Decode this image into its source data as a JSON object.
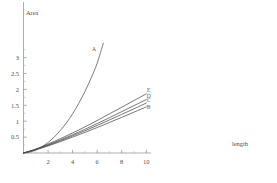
{
  "chart_data": {
    "type": "line",
    "title": "",
    "xlabel": "length",
    "ylabel": "Area",
    "xlim": [
      0,
      10.4
    ],
    "ylim": [
      0,
      3.45
    ],
    "grid": false,
    "legend": "inline-curve-labels",
    "x_ticks": [
      2,
      4,
      6,
      8,
      10
    ],
    "x_tick_labels": [
      "2",
      "4",
      "6",
      "8",
      "10"
    ],
    "x_minor_ticks": [
      1,
      3,
      5,
      7,
      9
    ],
    "y_ticks": [
      0.5,
      1,
      1.5,
      2,
      2.5,
      3
    ],
    "y_tick_labels": [
      "0.5",
      "1",
      "1.5",
      "2",
      "2.5",
      "3"
    ],
    "y_minor_ticks": [
      0.25,
      0.75,
      1.25,
      1.75,
      2.25,
      2.75,
      3.25
    ],
    "series": [
      {
        "name": "A",
        "label": "A",
        "label_x": 5.75,
        "label_y": 3.22,
        "color": "#5a5a5a",
        "x": [
          0,
          0.5,
          1,
          1.5,
          2,
          2.5,
          3,
          3.5,
          4,
          4.5,
          5,
          5.5,
          6,
          6.5
        ],
        "y": [
          0,
          0.025,
          0.09,
          0.195,
          0.33,
          0.5,
          0.71,
          0.95,
          1.23,
          1.56,
          1.93,
          2.35,
          2.82,
          3.45
        ]
      },
      {
        "name": "E",
        "label": "E",
        "label_x": 10.2,
        "label_y": 1.92,
        "color": "#4a4a4a",
        "x": [
          0,
          1,
          2,
          3,
          4,
          5,
          6,
          7,
          8,
          9,
          10
        ],
        "y": [
          0,
          0.125,
          0.28,
          0.45,
          0.63,
          0.82,
          1.02,
          1.23,
          1.44,
          1.65,
          1.86
        ]
      },
      {
        "name": "D",
        "label": "D",
        "label_x": 10.2,
        "label_y": 1.73,
        "color": "#4a4a4a",
        "x": [
          0,
          1,
          2,
          3,
          4,
          5,
          6,
          7,
          8,
          9,
          10
        ],
        "y": [
          0,
          0.115,
          0.255,
          0.41,
          0.575,
          0.745,
          0.925,
          1.11,
          1.3,
          1.49,
          1.68
        ]
      },
      {
        "name": "C",
        "label": "C",
        "label_x": 10.2,
        "label_y": 1.6,
        "color": "#4a4a4a",
        "x": [
          0,
          1,
          2,
          3,
          4,
          5,
          6,
          7,
          8,
          9,
          10
        ],
        "y": [
          0,
          0.108,
          0.24,
          0.385,
          0.54,
          0.7,
          0.865,
          1.04,
          1.215,
          1.39,
          1.57
        ]
      },
      {
        "name": "B",
        "label": "B",
        "label_x": 10.2,
        "label_y": 1.38,
        "color": "#4a4a4a",
        "x": [
          0,
          1,
          2,
          3,
          4,
          5,
          6,
          7,
          8,
          9,
          10
        ],
        "y": [
          0,
          0.1,
          0.222,
          0.357,
          0.5,
          0.648,
          0.8,
          0.96,
          1.12,
          1.285,
          1.45
        ]
      }
    ]
  }
}
